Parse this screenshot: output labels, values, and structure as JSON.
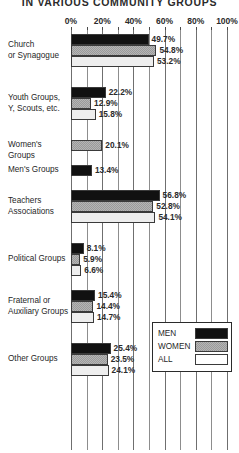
{
  "chart_data": {
    "type": "bar",
    "orientation": "horizontal",
    "title": "IN VARIOUS COMMUNITY GROUPS",
    "xlabel": "",
    "ylabel": "",
    "xlim": [
      0,
      100
    ],
    "xticks": [
      0,
      20,
      40,
      60,
      80,
      100
    ],
    "xtick_labels": [
      "0%",
      "20%",
      "40%",
      "60%",
      "80%",
      "100%"
    ],
    "minor_tick_interval": 10,
    "grid": true,
    "grid_axis": "x",
    "legend_position": "middle-right",
    "value_suffix": "%",
    "series": [
      {
        "name": "MEN",
        "color": "#111111",
        "values": [
          49.7,
          22.2,
          null,
          13.4,
          56.8,
          8.1,
          15.4,
          25.4
        ]
      },
      {
        "name": "WOMEN",
        "color": "#9a9a9a",
        "values": [
          54.8,
          12.9,
          20.1,
          null,
          52.8,
          5.9,
          14.4,
          23.5
        ]
      },
      {
        "name": "ALL",
        "color": "#eeeeee",
        "values": [
          53.2,
          15.8,
          null,
          null,
          54.1,
          6.6,
          14.7,
          24.1
        ]
      }
    ],
    "categories": [
      "Church or Synagogue",
      "Youth Groups, Y, Scouts, etc.",
      "Women's Groups",
      "Men's Groups",
      "Teachers Associations",
      "Political Groups",
      "Fraternal or Auxiliary Groups",
      "Other Groups"
    ]
  },
  "title": "IN VARIOUS COMMUNITY GROUPS",
  "axis": {
    "ticks": [
      {
        "label": "0%",
        "pct": 0
      },
      {
        "label": "20%",
        "pct": 20
      },
      {
        "label": "40%",
        "pct": 40
      },
      {
        "label": "60%",
        "pct": 60
      },
      {
        "label": "80%",
        "pct": 80
      },
      {
        "label": "100%",
        "pct": 100
      }
    ]
  },
  "groups": [
    {
      "label_line1": "Church",
      "label_line2": "or Synagogue",
      "bars": [
        {
          "series": "MEN",
          "value": 49.7,
          "value_text": "49.7%"
        },
        {
          "series": "WOMEN",
          "value": 54.8,
          "value_text": "54.8%"
        },
        {
          "series": "ALL",
          "value": 53.2,
          "value_text": "53.2%"
        }
      ]
    },
    {
      "label_line1": "Youth Groups,",
      "label_line2": "Y, Scouts, etc.",
      "bars": [
        {
          "series": "MEN",
          "value": 22.2,
          "value_text": "22.2%"
        },
        {
          "series": "WOMEN",
          "value": 12.9,
          "value_text": "12.9%"
        },
        {
          "series": "ALL",
          "value": 15.8,
          "value_text": "15.8%"
        }
      ]
    },
    {
      "label_line1": "Women's Groups",
      "label_line2": "",
      "bars": [
        {
          "series": "WOMEN",
          "value": 20.1,
          "value_text": "20.1%"
        }
      ]
    },
    {
      "label_line1": "Men's Groups",
      "label_line2": "",
      "bars": [
        {
          "series": "MEN",
          "value": 13.4,
          "value_text": "13.4%"
        }
      ]
    },
    {
      "label_line1": "Teachers",
      "label_line2": "Associations",
      "bars": [
        {
          "series": "MEN",
          "value": 56.8,
          "value_text": "56.8%"
        },
        {
          "series": "WOMEN",
          "value": 52.8,
          "value_text": "52.8%"
        },
        {
          "series": "ALL",
          "value": 54.1,
          "value_text": "54.1%"
        }
      ]
    },
    {
      "label_line1": "Political Groups",
      "label_line2": "",
      "bars": [
        {
          "series": "MEN",
          "value": 8.1,
          "value_text": "8.1%"
        },
        {
          "series": "WOMEN",
          "value": 5.9,
          "value_text": "5.9%"
        },
        {
          "series": "ALL",
          "value": 6.6,
          "value_text": "6.6%"
        }
      ]
    },
    {
      "label_line1": "Fraternal or",
      "label_line2": "Auxiliary Groups",
      "bars": [
        {
          "series": "MEN",
          "value": 15.4,
          "value_text": "15.4%"
        },
        {
          "series": "WOMEN",
          "value": 14.4,
          "value_text": "14.4%"
        },
        {
          "series": "ALL",
          "value": 14.7,
          "value_text": "14.7%"
        }
      ]
    },
    {
      "label_line1": "Other Groups",
      "label_line2": "",
      "bars": [
        {
          "series": "MEN",
          "value": 25.4,
          "value_text": "25.4%"
        },
        {
          "series": "WOMEN",
          "value": 23.5,
          "value_text": "23.5%"
        },
        {
          "series": "ALL",
          "value": 24.1,
          "value_text": "24.1%"
        }
      ]
    }
  ],
  "legend": {
    "items": [
      {
        "label": "MEN",
        "swatch": "men"
      },
      {
        "label": "WOMEN",
        "swatch": "women"
      },
      {
        "label": "ALL",
        "swatch": "all"
      }
    ]
  }
}
